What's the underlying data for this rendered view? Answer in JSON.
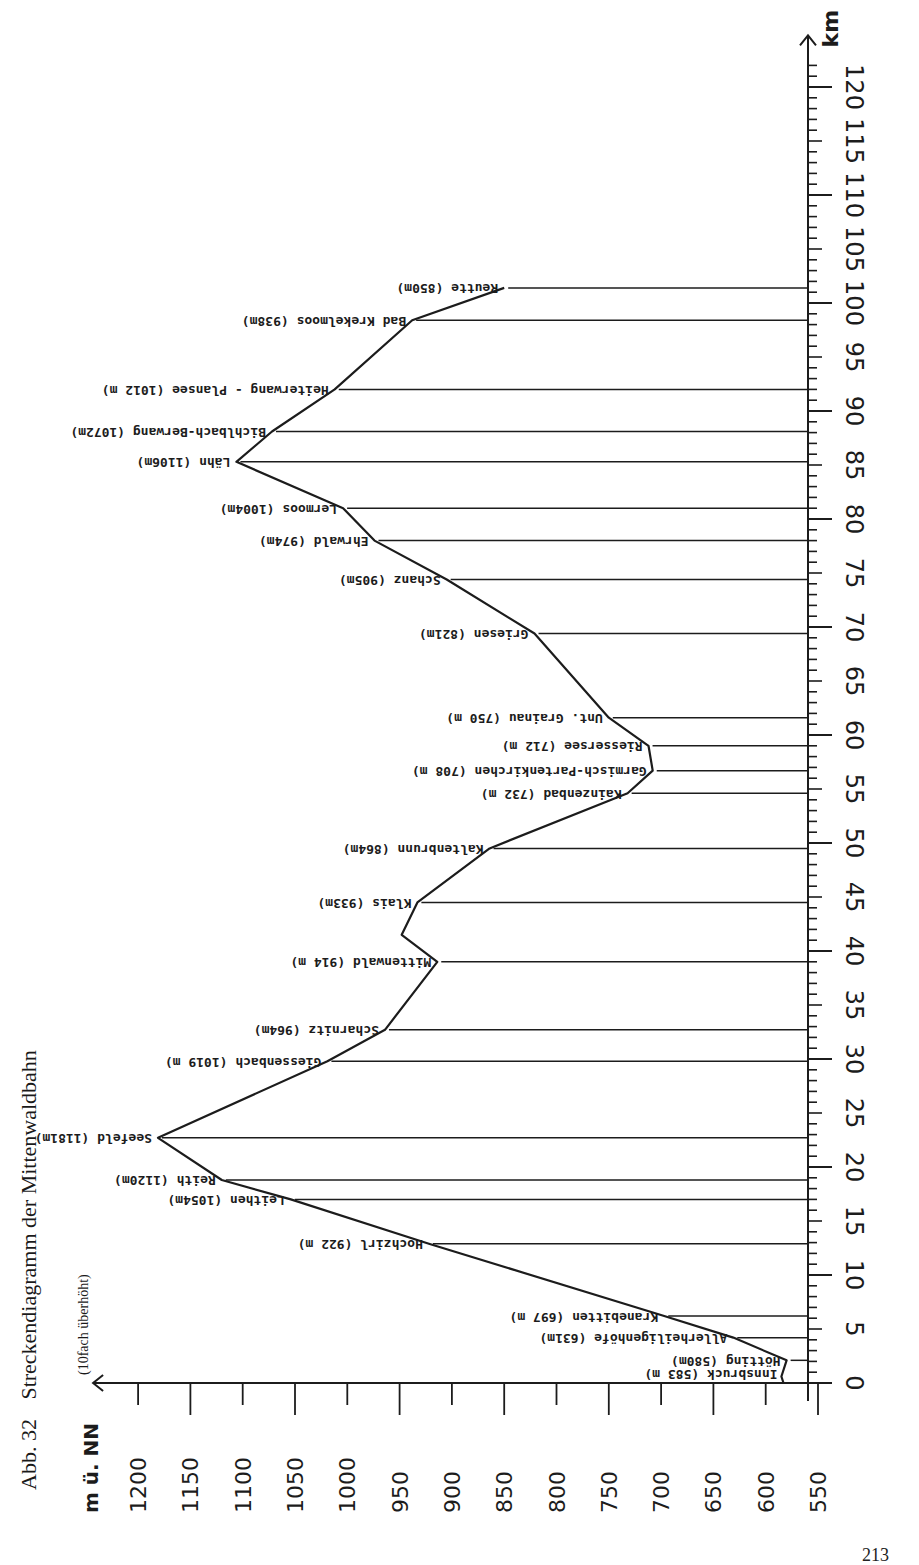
{
  "figure": {
    "number_label": "Abb. 32",
    "title": "Streckendiagramm der Mittenwaldbahn",
    "note": "(10fach überhöht)",
    "page_number": "213"
  },
  "chart_data": {
    "type": "line",
    "orientation": "rotated-90-ccw",
    "title": "Streckendiagramm der Mittenwaldbahn",
    "subtitle": "(10fach überhöht)",
    "xlabel": "km",
    "ylabel": "m ü. NN",
    "xlim": [
      0,
      122
    ],
    "ylim": [
      550,
      1200
    ],
    "x_ticks": [
      0,
      5,
      10,
      15,
      20,
      25,
      30,
      35,
      40,
      45,
      50,
      55,
      60,
      65,
      70,
      75,
      80,
      85,
      90,
      95,
      100,
      105,
      110,
      115,
      120
    ],
    "y_ticks": [
      550,
      600,
      650,
      700,
      750,
      800,
      850,
      900,
      950,
      1000,
      1050,
      1100,
      1150,
      1200
    ],
    "grid": false,
    "stations": [
      {
        "name": "Innsbruck",
        "label": "Innsbruck (583 m)",
        "km": 0.0,
        "elevation": 583
      },
      {
        "name": "Hötting",
        "label": "Hötting (580m)",
        "km": 2.1,
        "elevation": 580
      },
      {
        "name": "Allerheiligenhöfe",
        "label": "Allerheiligenhöfe (631m)",
        "km": 4.2,
        "elevation": 631
      },
      {
        "name": "Kranebitten",
        "label": "Kranebitten (697 m)",
        "km": 6.2,
        "elevation": 697
      },
      {
        "name": "Hochzirl",
        "label": "Hochzirl (922 m)",
        "km": 12.9,
        "elevation": 922
      },
      {
        "name": "Leithen",
        "label": "Leithen (1054m)",
        "km": 17.0,
        "elevation": 1054
      },
      {
        "name": "Reith",
        "label": "Reith (1120m)",
        "km": 18.8,
        "elevation": 1120
      },
      {
        "name": "Seefeld",
        "label": "Seefeld (1181m)",
        "km": 22.7,
        "elevation": 1181
      },
      {
        "name": "Giessenbach",
        "label": "Giessenbach (1019 m)",
        "km": 29.8,
        "elevation": 1019
      },
      {
        "name": "Scharnitz",
        "label": "Scharnitz (964m)",
        "km": 32.7,
        "elevation": 964
      },
      {
        "name": "Mittenwald",
        "label": "Mittenwald (914 m)",
        "km": 39.0,
        "elevation": 914
      },
      {
        "name": "Klais",
        "label": "Klais (933m)",
        "km": 44.5,
        "elevation": 933
      },
      {
        "name": "Kaltenbrunn",
        "label": "Kaltenbrunn (864m)",
        "km": 49.5,
        "elevation": 864
      },
      {
        "name": "Kainzenbad",
        "label": "Kainzenbad (732 m)",
        "km": 54.6,
        "elevation": 732
      },
      {
        "name": "Garmisch-Partenkirchen",
        "label": "Garmisch-Partenkirchen (708 m)",
        "km": 56.7,
        "elevation": 708
      },
      {
        "name": "Riessersee",
        "label": "Riessersee (712 m)",
        "km": 59.0,
        "elevation": 712
      },
      {
        "name": "Unt. Grainau",
        "label": "Unt. Grainau (750 m)",
        "km": 61.6,
        "elevation": 750
      },
      {
        "name": "Griesen",
        "label": "Griesen (821m)",
        "km": 69.4,
        "elevation": 821
      },
      {
        "name": "Schanz",
        "label": "Schanz (905m)",
        "km": 74.4,
        "elevation": 905
      },
      {
        "name": "Ehrwald",
        "label": "Ehrwald (974m)",
        "km": 78.0,
        "elevation": 974
      },
      {
        "name": "Lermoos",
        "label": "Lermoos (1004m)",
        "km": 81.0,
        "elevation": 1004
      },
      {
        "name": "Lähn",
        "label": "Lähn (1106m)",
        "km": 85.3,
        "elevation": 1106
      },
      {
        "name": "Bichlbach-Berwang",
        "label": "Bichlbach-Berwang (1072m)",
        "km": 88.1,
        "elevation": 1072
      },
      {
        "name": "Heiterwang-Plansee",
        "label": "Heiterwang - Plansee (1012 m)",
        "km": 92.0,
        "elevation": 1012
      },
      {
        "name": "Bad Kreckelmoos",
        "label": "Bad Krekelmoos (938m)",
        "km": 98.4,
        "elevation": 938
      },
      {
        "name": "Reutte",
        "label": "Reutte (850m)",
        "km": 101.4,
        "elevation": 850
      }
    ],
    "profile": [
      {
        "km": 0.0,
        "elevation": 583
      },
      {
        "km": 0.6,
        "elevation": 585
      },
      {
        "km": 2.1,
        "elevation": 580
      },
      {
        "km": 4.2,
        "elevation": 631
      },
      {
        "km": 6.2,
        "elevation": 697
      },
      {
        "km": 12.9,
        "elevation": 922
      },
      {
        "km": 17.0,
        "elevation": 1054
      },
      {
        "km": 18.8,
        "elevation": 1120
      },
      {
        "km": 22.7,
        "elevation": 1181
      },
      {
        "km": 29.8,
        "elevation": 1019
      },
      {
        "km": 32.7,
        "elevation": 964
      },
      {
        "km": 39.0,
        "elevation": 914
      },
      {
        "km": 41.5,
        "elevation": 948
      },
      {
        "km": 44.5,
        "elevation": 933
      },
      {
        "km": 49.5,
        "elevation": 864
      },
      {
        "km": 54.6,
        "elevation": 732
      },
      {
        "km": 56.7,
        "elevation": 708
      },
      {
        "km": 59.0,
        "elevation": 712
      },
      {
        "km": 61.6,
        "elevation": 750
      },
      {
        "km": 69.4,
        "elevation": 821
      },
      {
        "km": 74.4,
        "elevation": 905
      },
      {
        "km": 78.0,
        "elevation": 974
      },
      {
        "km": 81.0,
        "elevation": 1004
      },
      {
        "km": 85.3,
        "elevation": 1106
      },
      {
        "km": 88.1,
        "elevation": 1072
      },
      {
        "km": 92.0,
        "elevation": 1012
      },
      {
        "km": 98.4,
        "elevation": 938
      },
      {
        "km": 101.4,
        "elevation": 850
      }
    ]
  }
}
